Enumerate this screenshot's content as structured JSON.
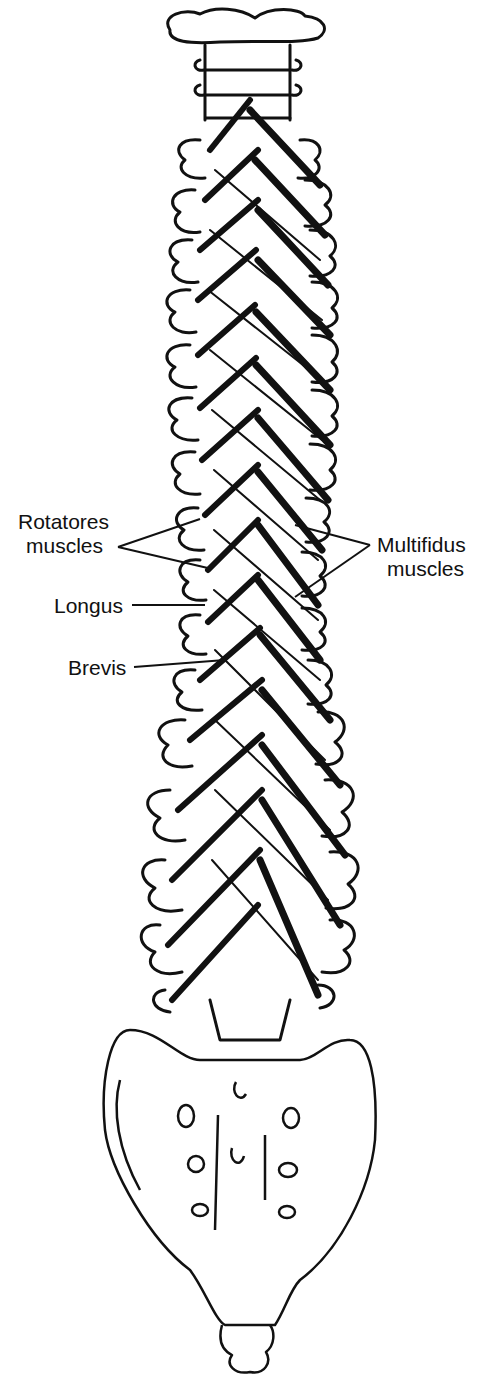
{
  "figure": {
    "labels": {
      "rotatores_line1": "Rotatores",
      "rotatores_line2": "muscles",
      "longus": "Longus",
      "brevis": "Brevis",
      "multifidus_line1": "Multifidus",
      "multifidus_line2": "muscles"
    },
    "colors": {
      "ink": "#111111",
      "background": "#ffffff"
    }
  }
}
